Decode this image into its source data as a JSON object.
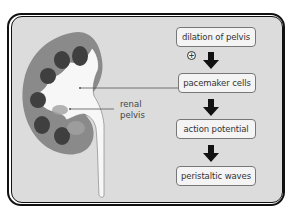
{
  "diagram": {
    "title": "",
    "kidney_label": {
      "line1": "renal",
      "line2": "pelvis"
    },
    "flow_steps": [
      {
        "label": "dilation of pelvis"
      },
      {
        "label": "pacemaker cells"
      },
      {
        "label": "action potential"
      },
      {
        "label": "peristaltic waves"
      }
    ],
    "stimulus_sign": "+",
    "colors": {
      "background": "#dcdcdc",
      "kidney_cortex": "#8a8a8a",
      "kidney_pyramids": "#444444",
      "renal_pelvis": "#f7f7f7",
      "box_fill": "#f4f4f4",
      "arrow": "#111111"
    }
  }
}
